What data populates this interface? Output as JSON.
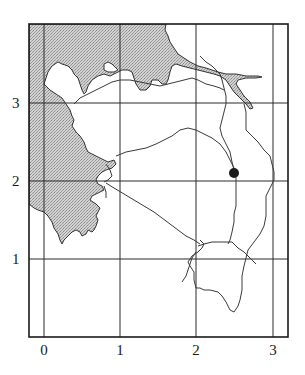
{
  "map": {
    "type": "grid-referenced coastal map",
    "frame": {
      "x0": 29,
      "y0": 24,
      "x1": 288,
      "y1": 337
    },
    "colors": {
      "frame": "#1a1a1a",
      "grid": "#2a2a2a",
      "sea_fill": "#c4c4c4",
      "land": "#ffffff",
      "lines": "#3a3a3a",
      "marker": "#1a1a1a"
    },
    "x_axis": {
      "ticks": [
        {
          "value": 0,
          "label": "0",
          "px": 44
        },
        {
          "value": 1,
          "label": "1",
          "px": 120
        },
        {
          "value": 2,
          "label": "2",
          "px": 196
        },
        {
          "value": 3,
          "label": "3",
          "px": 273
        }
      ]
    },
    "y_axis": {
      "ticks": [
        {
          "value": 1,
          "label": "1",
          "px": 259
        },
        {
          "value": 2,
          "label": "2",
          "px": 181
        },
        {
          "value": 3,
          "label": "3",
          "px": 103
        }
      ]
    },
    "features": {
      "shaded_sea": "Stippled water body along the west and north-west edge with an inlet/estuary extending east along the top",
      "roads_or_rivers": "Network of thin lines crossing the land area",
      "marker": {
        "label": "",
        "shape": "filled circle",
        "grid_x": 2.5,
        "grid_y": 2.1,
        "px": [
          234,
          173
        ]
      }
    }
  }
}
